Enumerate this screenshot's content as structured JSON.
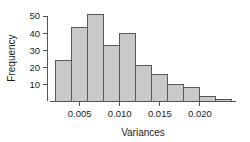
{
  "chart_data": {
    "type": "bar",
    "subtype": "histogram",
    "title": "",
    "xlabel": "Variances",
    "ylabel": "Frequency",
    "bin_edges": [
      0.002,
      0.004,
      0.006,
      0.008,
      0.01,
      0.012,
      0.014,
      0.016,
      0.018,
      0.02,
      0.022,
      0.024
    ],
    "categories": [
      "0.002-0.004",
      "0.004-0.006",
      "0.006-0.008",
      "0.008-0.010",
      "0.010-0.012",
      "0.012-0.014",
      "0.014-0.016",
      "0.016-0.018",
      "0.018-0.020",
      "0.020-0.022",
      "0.022-0.024"
    ],
    "values": [
      24,
      43,
      51,
      33,
      40,
      21,
      16,
      10,
      8,
      3,
      1
    ],
    "xlim": [
      0.0013,
      0.0245
    ],
    "ylim": [
      0,
      54
    ],
    "xticks": [
      0.005,
      0.01,
      0.015,
      0.02
    ],
    "xtick_labels": [
      "0.005",
      "0.010",
      "0.015",
      "0.020"
    ],
    "yticks": [
      10,
      20,
      30,
      40,
      50
    ],
    "ytick_labels": [
      "10",
      "20",
      "30",
      "40",
      "50"
    ],
    "grid": false,
    "legend": null,
    "bar_fill_color": "#c9c9c9",
    "bar_border_color": "#585858",
    "axis_color": "#545454"
  },
  "axes": {
    "y_title": "Frequency",
    "x_title": "Variances"
  }
}
